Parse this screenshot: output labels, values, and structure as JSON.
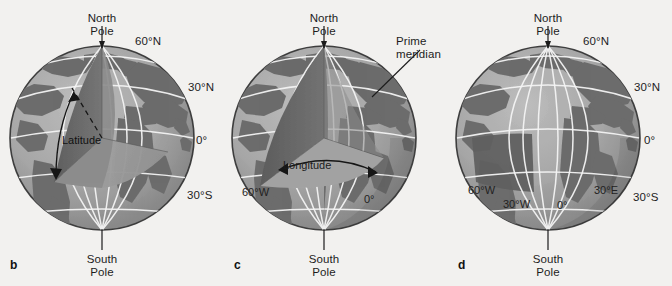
{
  "figure": {
    "background_color": "#f2f1ef",
    "land_color": "#6e6e6e",
    "ocean_color": "#a9a9a9",
    "wedge_light_color": "#9a9a9a",
    "wedge_dark_color": "#636363",
    "grid_color": "#f5f5f5",
    "outline_color": "#3a3a3a",
    "text_color": "#1d1d1d"
  },
  "panels": [
    {
      "letter": "b",
      "name": "latitude-globe",
      "north_pole_label": "North\nPole",
      "south_pole_label": "South\nPole",
      "callout_label": "Latitude",
      "latitude_ticks": [
        "60°N",
        "30°N",
        "0°",
        "30°S"
      ],
      "longitude_ticks": []
    },
    {
      "letter": "c",
      "name": "longitude-globe",
      "north_pole_label": "North\nPole",
      "south_pole_label": "South\nPole",
      "callout_label": "Longitude",
      "prime_meridian_label": "Prime\nmeridian",
      "latitude_ticks": [],
      "longitude_ticks": [
        "60°W",
        "0°"
      ]
    },
    {
      "letter": "d",
      "name": "latitude-longitude-grid-globe",
      "north_pole_label": "North\nPole",
      "south_pole_label": "South\nPole",
      "latitude_ticks": [
        "60°N",
        "30°N",
        "0°",
        "30°S"
      ],
      "longitude_ticks": [
        "60°W",
        "30°W",
        "0°",
        "30°E"
      ]
    }
  ]
}
